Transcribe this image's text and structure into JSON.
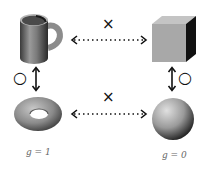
{
  "diagram": {
    "shapes": {
      "mug": {
        "name": "coffee mug"
      },
      "cube": {
        "name": "cube"
      },
      "torus": {
        "name": "torus",
        "genus_label": "g = 1"
      },
      "sphere": {
        "name": "sphere",
        "genus_label": "g = 0"
      }
    },
    "relations": {
      "top_horizontal": {
        "from": "mug",
        "to": "cube",
        "symbol": "×",
        "meaning": "not equivalent"
      },
      "bottom_horizontal": {
        "from": "torus",
        "to": "sphere",
        "symbol": "×",
        "meaning": "not equivalent"
      },
      "left_vertical": {
        "from": "mug",
        "to": "torus",
        "symbol": "○",
        "meaning": "equivalent"
      },
      "right_vertical": {
        "from": "cube",
        "to": "sphere",
        "symbol": "○",
        "meaning": "equivalent"
      }
    }
  }
}
